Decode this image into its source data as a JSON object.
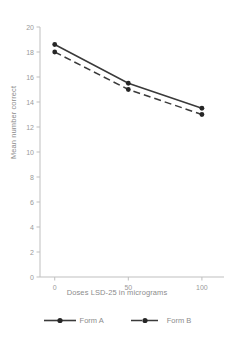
{
  "chart_data": {
    "type": "line",
    "title": "",
    "xlabel": "Doses LSD-25 in micrograms",
    "ylabel": "Mean number correct",
    "x": [
      0,
      50,
      100
    ],
    "xtick_labels": [
      "0",
      "50",
      "100"
    ],
    "xlim": [
      -10,
      115
    ],
    "ylim": [
      0,
      20
    ],
    "ytick_labels": [
      "0",
      "2",
      "4",
      "6",
      "8",
      "10",
      "12",
      "14",
      "16",
      "18",
      "20"
    ],
    "ytick_values": [
      0,
      2,
      4,
      6,
      8,
      10,
      12,
      14,
      16,
      18,
      20
    ],
    "grid": false,
    "legend_position": "bottom",
    "series": [
      {
        "name": "Form A",
        "values": [
          18.6,
          15.5,
          13.5
        ],
        "line_style": "solid",
        "color": "#3a3a3a",
        "marker": "circle"
      },
      {
        "name": "Form B",
        "values": [
          18.0,
          15.0,
          13.0
        ],
        "line_style": "dashed",
        "color": "#3a3a3a",
        "marker": "circle"
      }
    ]
  },
  "legend": {
    "entries": [
      {
        "label": "Form A"
      },
      {
        "label": "Form B"
      }
    ]
  },
  "colors": {
    "series": "#3a3a3a",
    "axis": "#bfbfbf",
    "text": "#8c8c8c",
    "background": "#ffffff"
  }
}
